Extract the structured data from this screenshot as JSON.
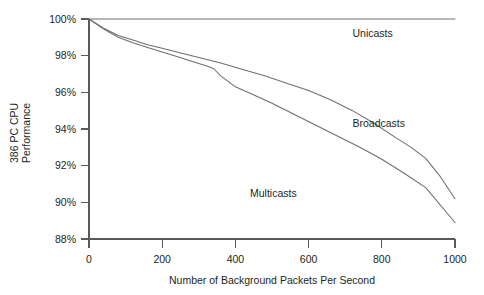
{
  "chart_data": {
    "type": "line",
    "title": "",
    "xlabel": "Number of Background Packets Per Second",
    "ylabel": "386 PC CPU Performance",
    "ylabel_line1": "386 PC CPU",
    "ylabel_line2": "Performance",
    "xlim": [
      0,
      1000
    ],
    "ylim": [
      88,
      100
    ],
    "grid": false,
    "legend_position": "inline-annotations",
    "xticks": [
      0,
      200,
      400,
      600,
      800,
      1000
    ],
    "xtick_labels": [
      "0",
      "200",
      "400",
      "600",
      "800",
      "1000"
    ],
    "yticks": [
      88,
      90,
      92,
      94,
      96,
      98,
      100
    ],
    "ytick_labels": [
      "88%",
      "90%",
      "92%",
      "94%",
      "96%",
      "98%",
      "100%"
    ],
    "series": [
      {
        "name": "Unicasts",
        "label": "Unicasts",
        "color": "#6d6e71",
        "label_x": 720,
        "label_y": 99.0,
        "x": [
          0,
          100,
          200,
          300,
          400,
          500,
          600,
          700,
          800,
          900,
          1000
        ],
        "values": [
          100,
          100,
          100,
          100,
          100,
          100,
          100,
          100,
          100,
          100,
          100
        ]
      },
      {
        "name": "Broadcasts",
        "label": "Broadcasts",
        "color": "#6d6e71",
        "label_x": 720,
        "label_y": 94.1,
        "x": [
          0,
          40,
          80,
          120,
          160,
          200,
          240,
          300,
          360,
          420,
          480,
          540,
          600,
          660,
          720,
          780,
          840,
          880,
          920,
          960,
          1000
        ],
        "values": [
          100,
          99.5,
          99.1,
          98.85,
          98.6,
          98.4,
          98.2,
          97.9,
          97.6,
          97.25,
          96.9,
          96.5,
          96.1,
          95.6,
          95.0,
          94.3,
          93.5,
          93.0,
          92.4,
          91.4,
          90.2
        ]
      },
      {
        "name": "Multicasts",
        "label": "Multicasts",
        "color": "#6d6e71",
        "label_x": 440,
        "label_y": 90.3,
        "x": [
          0,
          40,
          80,
          120,
          160,
          200,
          240,
          280,
          320,
          340,
          360,
          400,
          440,
          500,
          560,
          620,
          680,
          740,
          800,
          860,
          920,
          1000
        ],
        "values": [
          100,
          99.45,
          99.0,
          98.7,
          98.45,
          98.2,
          97.95,
          97.7,
          97.45,
          97.3,
          96.9,
          96.3,
          95.95,
          95.4,
          94.8,
          94.2,
          93.6,
          93.0,
          92.35,
          91.6,
          90.8,
          88.9
        ]
      }
    ]
  }
}
